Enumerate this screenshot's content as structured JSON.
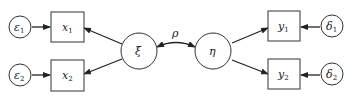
{
  "diagram": {
    "type": "structural-equation-model",
    "nodes": [
      {
        "id": "e1",
        "shape": "circle",
        "label": "ε",
        "sub": "1"
      },
      {
        "id": "e2",
        "shape": "circle",
        "label": "ε",
        "sub": "2"
      },
      {
        "id": "x1",
        "shape": "box",
        "label": "x",
        "sub": "1"
      },
      {
        "id": "x2",
        "shape": "box",
        "label": "x",
        "sub": "2"
      },
      {
        "id": "xi",
        "shape": "circle",
        "label": "ξ",
        "sub": ""
      },
      {
        "id": "eta",
        "shape": "circle",
        "label": "η",
        "sub": ""
      },
      {
        "id": "y1",
        "shape": "box",
        "label": "y",
        "sub": "1"
      },
      {
        "id": "y2",
        "shape": "box",
        "label": "y",
        "sub": "2"
      },
      {
        "id": "d1",
        "shape": "circle",
        "label": "δ",
        "sub": "1"
      },
      {
        "id": "d2",
        "shape": "circle",
        "label": "δ",
        "sub": "2"
      }
    ],
    "edges": [
      {
        "from": "e1",
        "to": "x1"
      },
      {
        "from": "e2",
        "to": "x2"
      },
      {
        "from": "xi",
        "to": "x1"
      },
      {
        "from": "xi",
        "to": "x2"
      },
      {
        "from": "xi",
        "to": "eta",
        "bidirectional": true,
        "label": "ρ"
      },
      {
        "from": "eta",
        "to": "y1"
      },
      {
        "from": "eta",
        "to": "y2"
      },
      {
        "from": "d1",
        "to": "y1"
      },
      {
        "from": "d2",
        "to": "y2"
      }
    ],
    "labels": {
      "e1": "ε",
      "e1_sub": "1",
      "e2": "ε",
      "e2_sub": "2",
      "x1": "x",
      "x1_sub": "1",
      "x2": "x",
      "x2_sub": "2",
      "xi": "ξ",
      "rho": "ρ",
      "eta": "η",
      "y1": "y",
      "y1_sub": "1",
      "y2": "y",
      "y2_sub": "2",
      "d1": "δ",
      "d1_sub": "1",
      "d2": "δ",
      "d2_sub": "2"
    }
  }
}
